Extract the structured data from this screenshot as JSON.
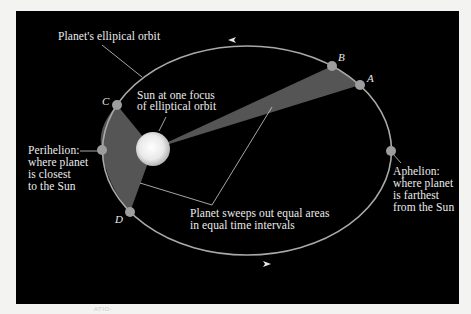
{
  "diagram": {
    "colors": {
      "page_background": "#f3f3f1",
      "panel_background": "#000000",
      "orbit": "#a9a9a9",
      "swept_area": "#555555",
      "planet_dot": "#9d9d9d",
      "sun": "#f4f4f4",
      "leader_line": "#cfcfcf",
      "text": "#ececec"
    },
    "labels": {
      "orbit": "Planet's ellipical orbit",
      "sun_line1": "Sun at one focus",
      "sun_line2": "of elliptical orbit",
      "perihelion_line1": "Perihelion:",
      "perihelion_line2": "where planet",
      "perihelion_line3": "is closest",
      "perihelion_line4": "to the Sun",
      "aphelion_line1": "Aphelion:",
      "aphelion_line2": "where planet",
      "aphelion_line3": "is farthest",
      "aphelion_line4": "from the Sun",
      "sweep_line1": "Planet sweeps out equal areas",
      "sweep_line2": "in equal time intervals"
    },
    "points": {
      "A": "A",
      "B": "B",
      "C": "C",
      "D": "D"
    },
    "bleed_through_text": "ATIO-"
  }
}
